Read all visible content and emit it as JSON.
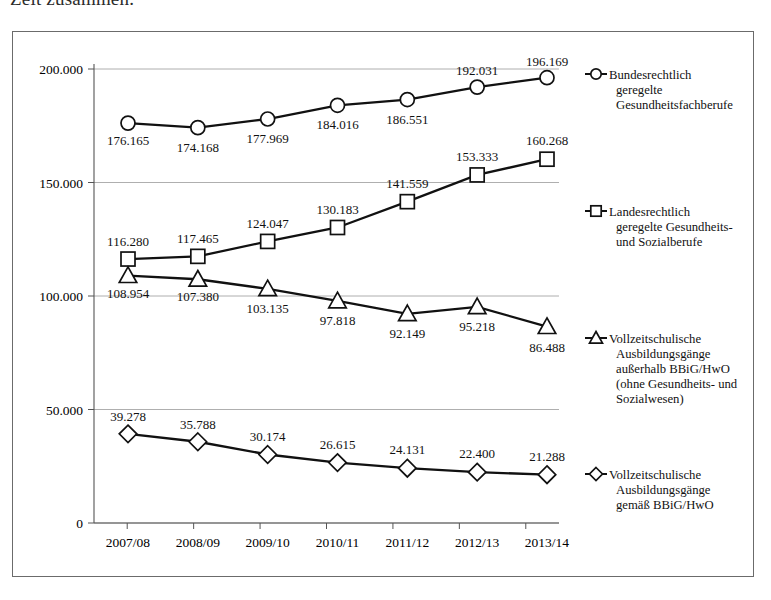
{
  "page": {
    "cut_off_heading": "Zeit zusammen."
  },
  "chart_data": {
    "type": "line",
    "title": "",
    "xlabel": "",
    "ylabel": "",
    "categories": [
      "2007/08",
      "2008/09",
      "2009/10",
      "2010/11",
      "2011/12",
      "2012/13",
      "2013/14"
    ],
    "ylim": [
      0,
      200000
    ],
    "yticks": [
      0,
      50000,
      100000,
      150000,
      200000
    ],
    "ytick_labels": [
      "0",
      "50.000",
      "100.000",
      "150.000",
      "200.000"
    ],
    "grid": true,
    "legend_position": "right",
    "series": [
      {
        "name": "Bundesrechtlich geregelte Gesundheitsfachberufe",
        "marker": "circle",
        "values": [
          176165,
          174168,
          177969,
          184016,
          186551,
          192031,
          196169
        ],
        "labels": [
          "176.165",
          "174.168",
          "177.969",
          "184.016",
          "186.551",
          "192.031",
          "196.169"
        ]
      },
      {
        "name": "Landesrechtlich geregelte Gesundheits- und Sozialberufe",
        "marker": "square",
        "values": [
          116280,
          117465,
          124047,
          130183,
          141559,
          153333,
          160268
        ],
        "labels": [
          "116.280",
          "117.465",
          "124.047",
          "130.183",
          "141.559",
          "153.333",
          "160.268"
        ]
      },
      {
        "name": "Vollzeitschulische Ausbildungsgänge außerhalb BBiG/HwO (ohne Gesundheits- und Sozialwesen)",
        "marker": "triangle",
        "values": [
          108954,
          107380,
          103135,
          97818,
          92149,
          95218,
          86488
        ],
        "labels": [
          "108.954",
          "107.380",
          "103.135",
          "97.818",
          "92.149",
          "95.218",
          "86.488"
        ]
      },
      {
        "name": "Vollzeitschulische Ausbildungsgänge gemäß BBiG/HwO",
        "marker": "diamond",
        "values": [
          39278,
          35788,
          30174,
          26615,
          24131,
          22400,
          21288
        ],
        "labels": [
          "39.278",
          "35.788",
          "30.174",
          "26.615",
          "24.131",
          "22.400",
          "21.288"
        ]
      }
    ]
  },
  "legend": {
    "entries": [
      {
        "marker": "circle",
        "lines": [
          "Bundesrechtlich",
          "geregelte",
          "Gesundheitsfachberufe"
        ]
      },
      {
        "marker": "square",
        "lines": [
          "Landesrechtlich",
          "geregelte Gesundheits-",
          "und Sozialberufe"
        ]
      },
      {
        "marker": "triangle",
        "lines": [
          "Vollzeitschulische",
          "Ausbildungsgänge",
          "außerhalb BBiG/HwO",
          "(ohne Gesundheits- und",
          "Sozialwesen)"
        ]
      },
      {
        "marker": "diamond",
        "lines": [
          "Vollzeitschulische",
          "Ausbildungsgänge",
          "gemäß BBiG/HwO"
        ]
      }
    ]
  },
  "colors": {
    "ink": "#111111",
    "frame": "#6b6b6b",
    "grid": "#9a9a9a",
    "background": "#ffffff"
  }
}
